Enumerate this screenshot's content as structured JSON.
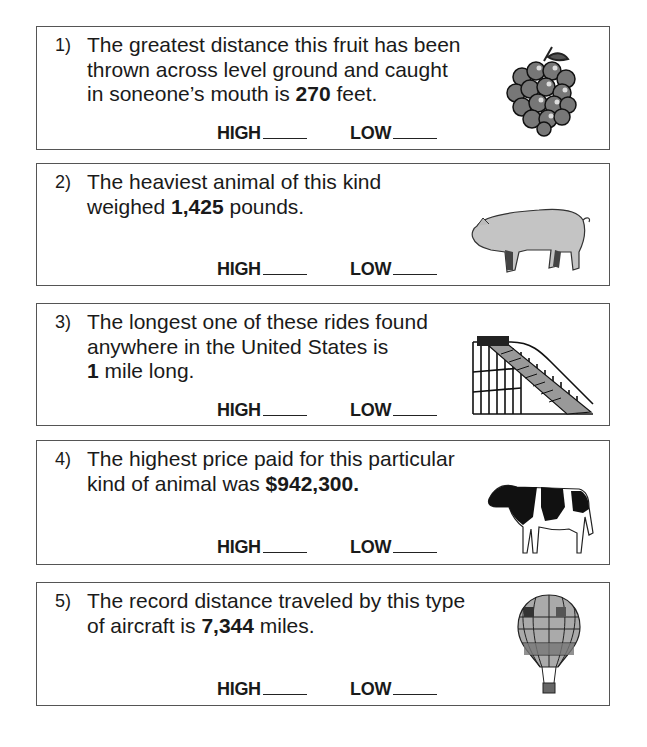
{
  "questions": [
    {
      "number": "1)",
      "lines": [
        "The greatest distance this fruit has been",
        "thrown across level ground and caught",
        "in soneone’s mouth is ",
        "270",
        " feet."
      ],
      "value": "270",
      "high_label": "HIGH",
      "low_label": "LOW",
      "icon": "grapes-icon"
    },
    {
      "number": "2)",
      "lines": [
        "The heaviest animal of this kind",
        "weighed ",
        "1,425",
        " pounds."
      ],
      "value": "1,425",
      "high_label": "HIGH",
      "low_label": "LOW",
      "icon": "pig-icon"
    },
    {
      "number": "3)",
      "lines": [
        "The longest one of these rides found",
        "anywhere in the United States is",
        "1",
        " mile long."
      ],
      "value": "1",
      "high_label": "HIGH",
      "low_label": "LOW",
      "icon": "roller-coaster-icon"
    },
    {
      "number": "4)",
      "lines": [
        "The highest price paid for this particular",
        "kind of animal was ",
        "$942,300."
      ],
      "value": "$942,300.",
      "high_label": "HIGH",
      "low_label": "LOW",
      "icon": "cow-icon"
    },
    {
      "number": "5)",
      "lines": [
        "The record distance traveled by this type",
        "of aircraft is ",
        "7,344",
        " miles."
      ],
      "value": "7,344",
      "high_label": "HIGH",
      "low_label": "LOW",
      "icon": "hot-air-balloon-icon"
    }
  ]
}
